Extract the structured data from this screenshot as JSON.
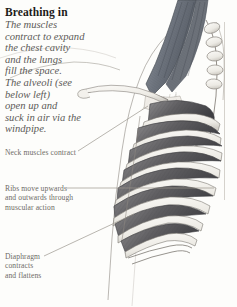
{
  "page": {
    "background_color": "#fdfdfb",
    "width": 237,
    "height": 307
  },
  "article": {
    "title": "Breathing in",
    "title_color": "#1c1b19",
    "body_color": "#5c5a57",
    "body_lines": [
      "The muscles",
      "contract to expand",
      "the chest cavity",
      "and the lungs",
      "fill the space.",
      "The alveoli (see",
      "below left)",
      "open up and",
      "suck in air via the",
      "windpipe."
    ]
  },
  "callouts": {
    "label_color": "#6e6b66",
    "neck": {
      "lines": [
        "Neck muscles contract"
      ]
    },
    "ribs": {
      "lines": [
        "Ribs move upwards",
        "and outwards through",
        "muscular action"
      ]
    },
    "diaphragm": {
      "lines": [
        "Diaphragm",
        "contracts",
        "and flattens"
      ]
    }
  },
  "illustration": {
    "name": "rib-cage-breathing-in-diagram",
    "description": "Anatomical side view of a human rib cage with neck muscles, clavicle, shoulder blade and spine",
    "colors": {
      "bone": "#f4f2ee",
      "bone_shadow": "#cfccc6",
      "outline": "#6b6862",
      "intercostal_muscle": "#6f6e70",
      "intercostal_muscle_dark": "#4a4a4d",
      "neck_muscle": "#7b8089",
      "neck_muscle_dark": "#565c66",
      "leader_line": "#9b968e",
      "panel_border": "#bdb9b2"
    }
  }
}
